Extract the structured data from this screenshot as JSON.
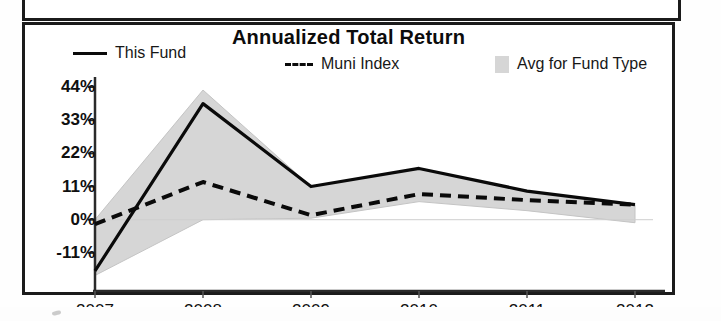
{
  "chart_data": {
    "type": "line",
    "title": "Annualized Total Return",
    "xlabel": "",
    "ylabel": "",
    "categories": [
      "2007",
      "2008",
      "2009",
      "2010",
      "2011",
      "2012"
    ],
    "x_axis_suffix": "YTD",
    "ytick_labels": [
      "44%",
      "33%",
      "22%",
      "11%",
      "0%",
      "-11%"
    ],
    "ytick_values": [
      44,
      33,
      22,
      11,
      0,
      -11
    ],
    "ylim": [
      -19,
      46
    ],
    "grid": false,
    "legend_position": "top",
    "series": [
      {
        "name": "This Fund",
        "style": "solid",
        "color": "#0a0a0a",
        "values": [
          -17.0,
          38.5,
          11.0,
          17.0,
          9.5,
          5.0
        ]
      },
      {
        "name": "Muni Index",
        "style": "dashed",
        "color": "#0a0a0a",
        "values": [
          -1.5,
          12.5,
          1.5,
          8.5,
          6.5,
          5.0
        ]
      },
      {
        "name": "Avg for Fund Type",
        "style": "band",
        "color": "#d6d6d6",
        "upper": [
          0.0,
          43.0,
          11.0,
          17.0,
          9.5,
          5.0
        ],
        "lower": [
          -18.5,
          0.0,
          0.5,
          6.0,
          3.0,
          -1.0
        ]
      }
    ]
  },
  "legend": {
    "this_fund": "This Fund",
    "muni_index": "Muni Index",
    "avg_fund_type": "Avg for Fund Type"
  }
}
